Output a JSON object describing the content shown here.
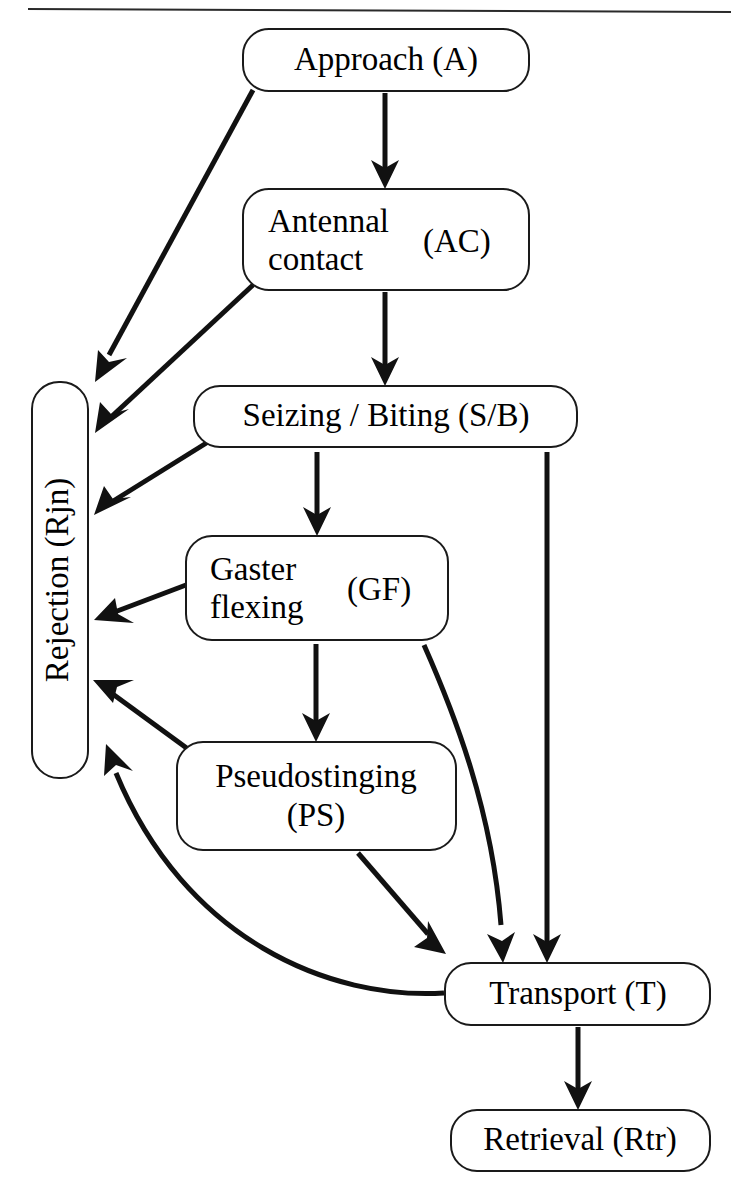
{
  "figure": {
    "type": "flowchart",
    "background_color": "#ffffff",
    "line_color": "#111111",
    "text_color": "#000000",
    "has_top_rule": true
  },
  "nodes": [
    {
      "id": "approach",
      "name": "Approach (A)",
      "label_main": "Approach (A)",
      "code": "A",
      "x": 243,
      "y": 29,
      "w": 286,
      "h": 62,
      "rx": 26,
      "font_size": 33,
      "orientation": "horizontal",
      "lines": [
        "Approach (A)"
      ]
    },
    {
      "id": "antennal-contact",
      "name": "Antennal contact (AC)",
      "label_main": "Antennal contact",
      "code": "AC",
      "x": 243,
      "y": 189,
      "w": 286,
      "h": 101,
      "rx": 26,
      "font_size": 33,
      "orientation": "horizontal",
      "lines": [
        "Antennal",
        "contact"
      ],
      "code_label": "(AC)"
    },
    {
      "id": "seizing-biting",
      "name": "Seizing / Biting (S/B)",
      "label_main": "Seizing / Biting (S/B)",
      "code": "S/B",
      "x": 194,
      "y": 386,
      "w": 383,
      "h": 61,
      "rx": 26,
      "font_size": 33,
      "orientation": "horizontal",
      "lines": [
        "Seizing / Biting (S/B)"
      ]
    },
    {
      "id": "gaster-flexing",
      "name": "Gaster flexing (GF)",
      "label_main": "Gaster flexing",
      "code": "GF",
      "x": 186,
      "y": 536,
      "w": 262,
      "h": 104,
      "rx": 26,
      "font_size": 33,
      "orientation": "horizontal",
      "lines": [
        "Gaster",
        "flexing"
      ],
      "code_label": "(GF)"
    },
    {
      "id": "pseudostinging",
      "name": "Pseudostinging (PS)",
      "label_main": "Pseudostinging",
      "code": "PS",
      "x": 177,
      "y": 742,
      "w": 279,
      "h": 108,
      "rx": 26,
      "font_size": 33,
      "orientation": "horizontal",
      "lines": [
        "Pseudostinging",
        "(PS)"
      ]
    },
    {
      "id": "rejection",
      "name": "Rejection (Rjn)",
      "label_main": "Rejection (Rjn)",
      "code": "Rjn",
      "x": 32,
      "y": 382,
      "w": 56,
      "h": 396,
      "rx": 27,
      "font_size": 33,
      "orientation": "vertical",
      "lines": [
        "Rejection (Rjn)"
      ]
    },
    {
      "id": "transport",
      "name": "Transport (T)",
      "label_main": "Transport (T)",
      "code": "T",
      "x": 445,
      "y": 963,
      "w": 265,
      "h": 62,
      "rx": 26,
      "font_size": 33,
      "orientation": "horizontal",
      "lines": [
        "Transport (T)"
      ]
    },
    {
      "id": "retrieval",
      "name": "Retrieval (Rtr)",
      "label_main": "Retrieval (Rtr)",
      "code": "Rtr",
      "x": 451,
      "y": 1110,
      "w": 259,
      "h": 61,
      "rx": 26,
      "font_size": 33,
      "orientation": "horizontal",
      "lines": [
        "Retrieval (Rtr)"
      ]
    }
  ],
  "edges": [
    {
      "id": "a-to-ac",
      "from": "Approach (A)",
      "to": "Antennal contact (AC)",
      "style": "straight"
    },
    {
      "id": "a-to-rjn",
      "from": "Approach (A)",
      "to": "Rejection (Rjn)",
      "style": "straight"
    },
    {
      "id": "ac-to-sb",
      "from": "Antennal contact (AC)",
      "to": "Seizing / Biting (S/B)",
      "style": "straight"
    },
    {
      "id": "ac-to-rjn",
      "from": "Antennal contact (AC)",
      "to": "Rejection (Rjn)",
      "style": "straight"
    },
    {
      "id": "sb-to-gf",
      "from": "Seizing / Biting (S/B)",
      "to": "Gaster flexing (GF)",
      "style": "straight"
    },
    {
      "id": "sb-to-rjn",
      "from": "Seizing / Biting (S/B)",
      "to": "Rejection (Rjn)",
      "style": "straight"
    },
    {
      "id": "sb-to-t",
      "from": "Seizing / Biting (S/B)",
      "to": "Transport (T)",
      "style": "straight"
    },
    {
      "id": "gf-to-ps",
      "from": "Gaster flexing (GF)",
      "to": "Pseudostinging (PS)",
      "style": "straight"
    },
    {
      "id": "gf-to-rjn",
      "from": "Gaster flexing (GF)",
      "to": "Rejection (Rjn)",
      "style": "straight"
    },
    {
      "id": "gf-to-t",
      "from": "Gaster flexing (GF)",
      "to": "Transport (T)",
      "style": "curved"
    },
    {
      "id": "ps-to-rjn",
      "from": "Pseudostinging (PS)",
      "to": "Rejection (Rjn)",
      "style": "straight"
    },
    {
      "id": "ps-to-t",
      "from": "Pseudostinging (PS)",
      "to": "Transport (T)",
      "style": "straight"
    },
    {
      "id": "t-to-rjn",
      "from": "Transport (T)",
      "to": "Rejection (Rjn)",
      "style": "curved"
    },
    {
      "id": "t-to-rtr",
      "from": "Transport (T)",
      "to": "Retrieval (Rtr)",
      "style": "straight"
    }
  ]
}
